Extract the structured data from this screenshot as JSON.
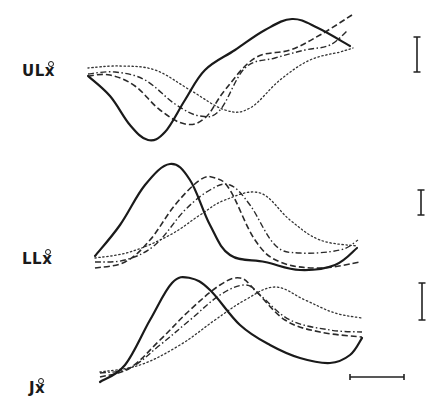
{
  "chart_data": {
    "type": "line",
    "title": "",
    "xlabel": "",
    "ylabel": "",
    "grid": false,
    "legend": "none",
    "line_styles": [
      "solid",
      "dashed",
      "dash-dot",
      "dotted"
    ],
    "panels": [
      {
        "label": "ULẋ",
        "label_base": "UL",
        "label_var": "x",
        "description": "Upper lip velocity: solid dips to minimum then rises to a late peak; dashed, dash-dot and dotted traces lag progressively with shallower minima",
        "series": [
          {
            "name": "solid",
            "points": [
              [
                88,
                76
              ],
              [
                110,
                96
              ],
              [
                130,
                125
              ],
              [
                148,
                140
              ],
              [
                165,
                132
              ],
              [
                185,
                100
              ],
              [
                205,
                70
              ],
              [
                235,
                50
              ],
              [
                265,
                30
              ],
              [
                292,
                19
              ],
              [
                318,
                28
              ],
              [
                350,
                46
              ]
            ]
          },
          {
            "name": "dashed",
            "points": [
              [
                88,
                76
              ],
              [
                110,
                75
              ],
              [
                135,
                86
              ],
              [
                160,
                110
              ],
              [
                185,
                124
              ],
              [
                205,
                118
              ],
              [
                225,
                90
              ],
              [
                255,
                58
              ],
              [
                290,
                50
              ],
              [
                320,
                35
              ],
              [
                352,
                15
              ]
            ]
          },
          {
            "name": "dash-dot",
            "points": [
              [
                88,
                74
              ],
              [
                115,
                72
              ],
              [
                145,
                80
              ],
              [
                175,
                104
              ],
              [
                200,
                116
              ],
              [
                220,
                110
              ],
              [
                245,
                68
              ],
              [
                275,
                58
              ],
              [
                305,
                50
              ],
              [
                330,
                45
              ],
              [
                348,
                30
              ]
            ]
          },
          {
            "name": "dotted",
            "points": [
              [
                88,
                68
              ],
              [
                120,
                66
              ],
              [
                155,
                70
              ],
              [
                190,
                90
              ],
              [
                225,
                110
              ],
              [
                250,
                108
              ],
              [
                280,
                80
              ],
              [
                310,
                60
              ],
              [
                340,
                52
              ],
              [
                353,
                48
              ]
            ]
          }
        ],
        "scale_bar": {
          "orientation": "vertical",
          "x": 417,
          "y1": 37,
          "y2": 72
        }
      },
      {
        "label": "LLẋ",
        "label_base": "LL",
        "label_var": "x",
        "description": "Lower lip velocity: solid rises to early sharp peak then falls to a low plateau; other traces peak later and lower",
        "series": [
          {
            "name": "solid",
            "points": [
              [
                95,
                256
              ],
              [
                120,
                225
              ],
              [
                145,
                185
              ],
              [
                170,
                164
              ],
              [
                190,
                180
              ],
              [
                210,
                225
              ],
              [
                230,
                255
              ],
              [
                265,
                262
              ],
              [
                300,
                270
              ],
              [
                335,
                265
              ],
              [
                357,
                248
              ]
            ]
          },
          {
            "name": "dashed",
            "points": [
              [
                95,
                268
              ],
              [
                125,
                262
              ],
              [
                150,
                240
              ],
              [
                175,
                205
              ],
              [
                200,
                180
              ],
              [
                215,
                178
              ],
              [
                230,
                190
              ],
              [
                255,
                240
              ],
              [
                280,
                262
              ],
              [
                320,
                268
              ],
              [
                360,
                262
              ]
            ]
          },
          {
            "name": "dash-dot",
            "points": [
              [
                95,
                262
              ],
              [
                125,
                260
              ],
              [
                155,
                245
              ],
              [
                185,
                210
              ],
              [
                210,
                190
              ],
              [
                230,
                185
              ],
              [
                250,
                205
              ],
              [
                275,
                245
              ],
              [
                300,
                253
              ],
              [
                340,
                250
              ],
              [
                358,
                240
              ]
            ]
          },
          {
            "name": "dotted",
            "points": [
              [
                95,
                258
              ],
              [
                130,
                252
              ],
              [
                170,
                235
              ],
              [
                200,
                215
              ],
              [
                225,
                200
              ],
              [
                260,
                193
              ],
              [
                290,
                220
              ],
              [
                320,
                240
              ],
              [
                357,
                246
              ]
            ]
          }
        ],
        "scale_bar": {
          "orientation": "vertical",
          "x": 421,
          "y1": 190,
          "y2": 215
        }
      },
      {
        "label": "Jẋ",
        "label_base": "J",
        "label_var": "x",
        "description": "Jaw velocity: solid rises to peak and falls to a deep late minimum before turning up; dashed and dash-dot lag; dotted lowest and latest",
        "series": [
          {
            "name": "solid",
            "points": [
              [
                100,
                382
              ],
              [
                125,
                365
              ],
              [
                150,
                320
              ],
              [
                172,
                283
              ],
              [
                190,
                278
              ],
              [
                210,
                290
              ],
              [
                240,
                325
              ],
              [
                270,
                345
              ],
              [
                300,
                358
              ],
              [
                330,
                363
              ],
              [
                350,
                355
              ],
              [
                362,
                338
              ]
            ]
          },
          {
            "name": "dashed",
            "points": [
              [
                100,
                377
              ],
              [
                130,
                368
              ],
              [
                160,
                340
              ],
              [
                190,
                310
              ],
              [
                220,
                285
              ],
              [
                240,
                278
              ],
              [
                255,
                290
              ],
              [
                285,
                320
              ],
              [
                320,
                332
              ],
              [
                362,
                337
              ]
            ]
          },
          {
            "name": "dash-dot",
            "points": [
              [
                100,
                373
              ],
              [
                130,
                368
              ],
              [
                160,
                345
              ],
              [
                190,
                320
              ],
              [
                220,
                295
              ],
              [
                245,
                285
              ],
              [
                260,
                295
              ],
              [
                290,
                320
              ],
              [
                330,
                330
              ],
              [
                362,
                332
              ]
            ]
          },
          {
            "name": "dotted",
            "points": [
              [
                100,
                372
              ],
              [
                140,
                365
              ],
              [
                180,
                345
              ],
              [
                215,
                320
              ],
              [
                245,
                300
              ],
              [
                275,
                287
              ],
              [
                305,
                300
              ],
              [
                335,
                313
              ],
              [
                362,
                318
              ]
            ]
          }
        ],
        "scale_bar": {
          "orientation": "vertical",
          "x": 422,
          "y1": 283,
          "y2": 320
        }
      }
    ],
    "time_scale_bar": {
      "orientation": "horizontal",
      "x1": 350,
      "x2": 404,
      "y": 377
    }
  },
  "labels": {
    "ul_base": "UL",
    "ul_var": "x",
    "ll_base": "LL",
    "ll_var": "x",
    "j_base": "J",
    "j_var": "x"
  }
}
